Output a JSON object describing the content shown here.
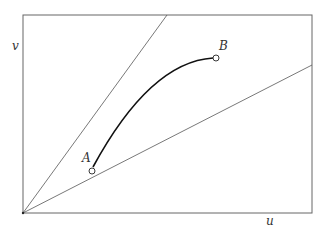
{
  "diagram": {
    "axes": {
      "x_label": "u",
      "y_label": "v"
    },
    "points": [
      {
        "label": "A",
        "role": "start"
      },
      {
        "label": "B",
        "role": "end"
      }
    ],
    "rays": [
      {
        "name": "upper-ray",
        "from": "origin"
      },
      {
        "name": "lower-ray",
        "from": "origin"
      }
    ],
    "colors": {
      "frame": "#666666",
      "ray": "#555555",
      "curve": "#111111",
      "text": "#333333"
    }
  }
}
